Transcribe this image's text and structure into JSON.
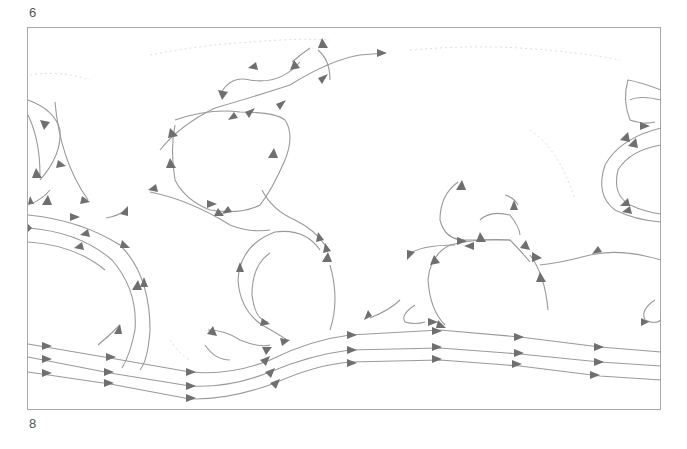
{
  "page": {
    "label_top": "6",
    "label_bottom": "8"
  },
  "map": {
    "title": "",
    "type": "world-ocean-currents-schematic",
    "frame_color": "#a8a8a8",
    "current_line_color": "#9a9a9a",
    "arrow_color": "#6f6f6f",
    "gyres": [
      {
        "name": "north-pacific-west-gyre",
        "direction": "clockwise"
      },
      {
        "name": "north-atlantic-gyre",
        "direction": "clockwise"
      },
      {
        "name": "south-atlantic-gyre",
        "direction": "counterclockwise"
      },
      {
        "name": "indian-ocean-gyre",
        "direction": "counterclockwise"
      },
      {
        "name": "pacific-east-gyre",
        "direction": "clockwise"
      },
      {
        "name": "south-pacific-gyre",
        "direction": "counterclockwise"
      }
    ],
    "bands": [
      {
        "name": "antarctic-circumpolar-current",
        "direction": "eastward",
        "lines": 3
      }
    ]
  }
}
